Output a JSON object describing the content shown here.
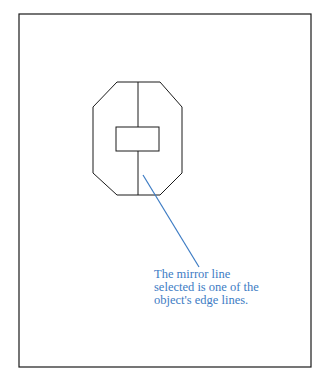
{
  "figure": {
    "caption_lines": [
      "The mirror line",
      "selected is one of the",
      "object's edge lines."
    ],
    "colors": {
      "frame": "#1a1a1a",
      "shape": "#1a1a1a",
      "leader": "#3d7cc4",
      "caption": "#3d7cc4"
    }
  }
}
